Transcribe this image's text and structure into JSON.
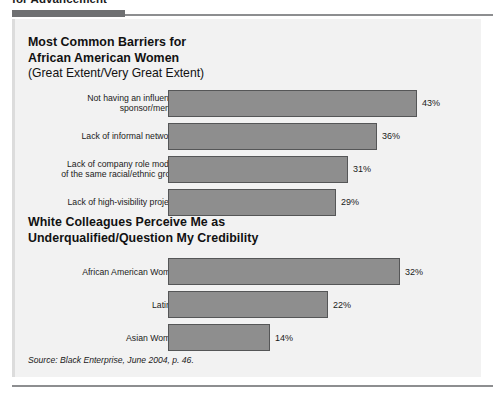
{
  "page": {
    "cut_off_heading": "for Advancement",
    "source_prefix": "Source: ",
    "source_publication": "Black Enterprise",
    "source_suffix": ", June 2004, p. 46."
  },
  "colors": {
    "bar_fill": "#8e8e8e",
    "bar_border": "#555657",
    "panel_background": "#f2f2f2",
    "rule": "#8d8e90",
    "rule_thick": "#6f7072",
    "text": "#1a1a1a"
  },
  "chart_data": [
    {
      "type": "bar",
      "title": "Most Common Barriers for African American Women",
      "title_line1": "Most Common Barriers for",
      "title_line2": "African American Women",
      "subtitle": "(Great Extent/Very Great Extent)",
      "orientation": "horizontal",
      "xlabel": "",
      "ylabel": "",
      "xlim": [
        0,
        50
      ],
      "grid": false,
      "legend": false,
      "categories": [
        "Not having an influential sponsor/mentor",
        "Lack of informal networks",
        "Lack of company role models of the same racial/ethnic group",
        "Lack of high-visibility projects"
      ],
      "category_lines": [
        [
          "Not having an influential",
          "sponsor/mentor"
        ],
        [
          "Lack of informal networks"
        ],
        [
          "Lack of company role models",
          "of the same racial/ethnic group"
        ],
        [
          "Lack of high-visibility projects"
        ]
      ],
      "values": [
        43,
        36,
        31,
        29
      ],
      "value_labels": [
        "43%",
        "36%",
        "31%",
        "29%"
      ]
    },
    {
      "type": "bar",
      "title": "White Colleagues Perceive Me as Underqualified/Question My Credibility",
      "title_line1": "White Colleagues Perceive Me as",
      "title_line2": "Underqualified/Question My Credibility",
      "subtitle": "",
      "orientation": "horizontal",
      "xlabel": "",
      "ylabel": "",
      "xlim": [
        0,
        40
      ],
      "grid": false,
      "legend": false,
      "categories": [
        "African American Women",
        "Latinas",
        "Asian Women"
      ],
      "category_lines": [
        [
          "African American Women"
        ],
        [
          "Latinas"
        ],
        [
          "Asian Women"
        ]
      ],
      "values": [
        32,
        22,
        14
      ],
      "value_labels": [
        "32%",
        "22%",
        "14%"
      ]
    }
  ]
}
